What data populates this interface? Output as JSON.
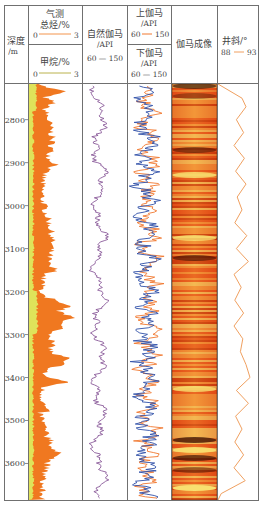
{
  "chart_data": {
    "type": "well-log",
    "depth_track": {
      "title": "深度",
      "unit": "/m",
      "ticks": [
        2800,
        2900,
        3000,
        3100,
        3200,
        3300,
        3400,
        3500,
        3600
      ],
      "range": [
        2717,
        3685
      ]
    },
    "tracks": [
      {
        "id": "gas",
        "curves": [
          {
            "name": "气测总烃/%",
            "name_line1": "气测",
            "name_line2": "总烃/%",
            "min": 0,
            "max": 3,
            "color": "#f07820",
            "fill": "#f07820"
          },
          {
            "name": "甲烷/%",
            "min": 0,
            "max": 3,
            "color": "#a8a020",
            "fill": "#dfe35a"
          }
        ]
      },
      {
        "id": "gr",
        "curves": [
          {
            "name": "自然伽马/API",
            "name_line1": "自然伽马",
            "name_line2": "/API",
            "min": 60,
            "max": 150,
            "color": "#8a5a9a"
          }
        ]
      },
      {
        "id": "updown-gr",
        "curves": [
          {
            "name": "上伽马/API",
            "name_line1": "上伽马",
            "name_line2": "/API",
            "min": 60,
            "max": 150,
            "color": "#f07830"
          },
          {
            "name": "下伽马/API",
            "name_line1": "下伽马",
            "name_line2": "/API",
            "min": 60,
            "max": 150,
            "color": "#3050a8"
          }
        ]
      },
      {
        "id": "image",
        "title": "伽马成像"
      },
      {
        "id": "incl",
        "curves": [
          {
            "name": "井斜/°",
            "min": 88,
            "max": 93,
            "color": "#f0a060"
          }
        ]
      }
    ],
    "inclination_profile": {
      "depths": [
        2717,
        2750,
        2770,
        2800,
        2830,
        2860,
        2890,
        2920,
        2950,
        2980,
        3010,
        3040,
        3070,
        3100,
        3130,
        3160,
        3190,
        3220,
        3250,
        3280,
        3310,
        3340,
        3370,
        3400,
        3430,
        3460,
        3490,
        3520,
        3550,
        3580,
        3610,
        3640,
        3670,
        3685
      ],
      "values": [
        88.0,
        91.0,
        91.5,
        90.3,
        91.2,
        90.0,
        91.3,
        90.2,
        91.5,
        90.4,
        91.0,
        90.1,
        91.6,
        90.3,
        91.8,
        90.0,
        90.9,
        90.1,
        91.2,
        90.0,
        91.1,
        90.8,
        91.5,
        92.0,
        90.3,
        91.8,
        90.2,
        91.0,
        90.1,
        91.2,
        90.0,
        91.4,
        88.4,
        88.0
      ]
    }
  },
  "header": {
    "depth_title": "深度",
    "depth_unit": "/m",
    "gas_total_line1": "气测",
    "gas_total_line2": "总烃/%",
    "gas_total_min": "0",
    "gas_total_max": "3",
    "methane_label": "甲烷/%",
    "methane_min": "0",
    "methane_max": "3",
    "gr_line1": "自然伽马",
    "gr_line2": "/API",
    "gr_range": "60 — 150",
    "up_gr_line1": "上伽马",
    "up_gr_line2": "/API",
    "up_gr_min": "60",
    "up_gr_max": "150",
    "down_gr_line1": "下伽马",
    "down_gr_line2": "/API",
    "down_gr_range": "60 — 150",
    "image_title": "伽马成像",
    "incl_label": "井斜/°",
    "incl_min": "88",
    "incl_max": "93"
  },
  "colors": {
    "grid": "#707070",
    "total_gas": "#f07820",
    "methane": "#dfe35a",
    "gr": "#8a5a9a",
    "up_gr": "#f07830",
    "down_gr": "#3050a8",
    "incl": "#f0a060",
    "image_dark": "#2a0800",
    "image_mid": "#e8501a",
    "image_light": "#f8e070"
  }
}
